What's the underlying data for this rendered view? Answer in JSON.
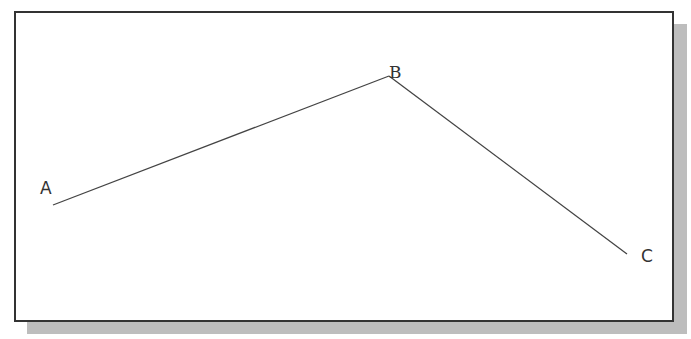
{
  "diagram": {
    "type": "polyline",
    "colors": {
      "frame_border": "#333333",
      "frame_fill": "#ffffff",
      "shadow": "#bdbdbd",
      "line": "#444444",
      "label": "#333333"
    },
    "points": [
      {
        "label": "A",
        "x": 53,
        "y": 205,
        "label_x": 40,
        "label_y": 194
      },
      {
        "label": "B",
        "x": 389,
        "y": 76,
        "label_x": 389,
        "label_y": 76
      },
      {
        "label": "C",
        "x": 627,
        "y": 254,
        "label_x": 641,
        "label_y": 262
      }
    ],
    "segments": [
      {
        "from": "A",
        "to": "B"
      },
      {
        "from": "B",
        "to": "C"
      }
    ]
  }
}
